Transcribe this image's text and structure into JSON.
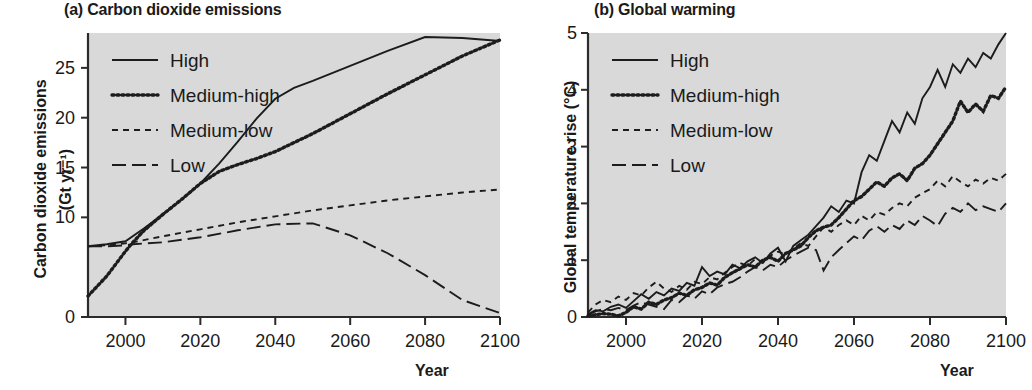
{
  "figure": {
    "background_color": "#ffffff",
    "plot_background_color": "#d9d9d9",
    "line_color": "#1c1c1c"
  },
  "panels": [
    {
      "key": "a",
      "title": "(a) Carbon dioxide emissions",
      "ylabel_line1": "Carbon dioxide emissions",
      "ylabel_line2": "(Gt yr⁻¹)",
      "xlabel": "Year"
    },
    {
      "key": "b",
      "title": "(b) Global warming",
      "ylabel_line1": "Global temperature rise (°C)",
      "ylabel_line2": "",
      "xlabel": "Year"
    }
  ],
  "legend": {
    "entries": [
      {
        "label": "High",
        "style": "solid",
        "dash": ""
      },
      {
        "label": "Medium-high",
        "style": "dotted",
        "dash": "2,3"
      },
      {
        "label": "Medium-low",
        "style": "dashed-short",
        "dash": "6,5"
      },
      {
        "label": "Low",
        "style": "dashed-long",
        "dash": "14,6"
      }
    ]
  },
  "chart_data": [
    {
      "type": "line",
      "panel": "a",
      "title": "(a) Carbon dioxide emissions",
      "xlabel": "Year",
      "ylabel": "Carbon dioxide emissions (Gt yr-1)",
      "xlim": [
        1990,
        2100
      ],
      "ylim": [
        0,
        28.5
      ],
      "xticks": [
        2000,
        2020,
        2040,
        2060,
        2080,
        2100
      ],
      "yticks": [
        0,
        10,
        15,
        20,
        25
      ],
      "ytick_labels": [
        "0",
        "10",
        "15",
        "20",
        "25"
      ],
      "grid": false,
      "legend_position": "upper-left-inside",
      "series": [
        {
          "name": "High",
          "dash": "",
          "x": [
            1990,
            1995,
            2000,
            2005,
            2010,
            2015,
            2020,
            2025,
            2030,
            2035,
            2040,
            2045,
            2050,
            2060,
            2070,
            2080,
            2090,
            2100
          ],
          "values": [
            7.1,
            7.3,
            7.6,
            8.9,
            10.3,
            11.8,
            13.4,
            15.4,
            17.6,
            19.9,
            21.9,
            23.0,
            23.7,
            25.2,
            26.7,
            28.1,
            28.0,
            27.7
          ]
        },
        {
          "name": "Medium-high",
          "dash": "2,3",
          "x": [
            1990,
            1995,
            2000,
            2002,
            2005,
            2010,
            2015,
            2020,
            2025,
            2030,
            2035,
            2040,
            2045,
            2050,
            2060,
            2070,
            2080,
            2090,
            2100
          ],
          "values": [
            2.1,
            4.1,
            6.6,
            7.5,
            8.7,
            10.3,
            11.8,
            13.4,
            14.6,
            15.3,
            15.9,
            16.6,
            17.5,
            18.4,
            20.4,
            22.4,
            24.3,
            26.2,
            27.8
          ]
        },
        {
          "name": "Medium-low",
          "dash": "6,5",
          "x": [
            1990,
            1995,
            2000,
            2002,
            2010,
            2020,
            2030,
            2040,
            2050,
            2060,
            2070,
            2080,
            2090,
            2100
          ],
          "values": [
            7.1,
            7.2,
            7.4,
            7.5,
            8.1,
            8.8,
            9.5,
            10.1,
            10.7,
            11.2,
            11.7,
            12.1,
            12.5,
            12.8
          ]
        },
        {
          "name": "Low",
          "dash": "14,6",
          "x": [
            1990,
            1995,
            2000,
            2002,
            2010,
            2020,
            2030,
            2040,
            2050,
            2060,
            2070,
            2080,
            2090,
            2100
          ],
          "values": [
            7.1,
            7.1,
            7.2,
            7.3,
            7.5,
            8.0,
            8.7,
            9.3,
            9.4,
            8.2,
            6.4,
            4.2,
            1.7,
            0.4
          ]
        }
      ]
    },
    {
      "type": "line",
      "panel": "b",
      "title": "(b) Global warming",
      "xlabel": "Year",
      "ylabel": "Global temperature rise (°C)",
      "xlim": [
        1990,
        2100
      ],
      "ylim": [
        0,
        5
      ],
      "xticks": [
        2000,
        2020,
        2040,
        2060,
        2080,
        2100
      ],
      "yticks": [
        0,
        1,
        2,
        3,
        4,
        5
      ],
      "ytick_labels": [
        "0",
        "1",
        "2",
        "3",
        "4",
        "5"
      ],
      "grid": false,
      "legend_position": "upper-left-inside",
      "note": "Interannually noisy realizations; yearly step series",
      "series": [
        {
          "name": "High",
          "dash": "",
          "x": [
            1990,
            1992,
            1994,
            1996,
            1998,
            2000,
            2002,
            2004,
            2006,
            2008,
            2010,
            2012,
            2014,
            2016,
            2018,
            2020,
            2022,
            2024,
            2026,
            2028,
            2030,
            2032,
            2034,
            2036,
            2038,
            2040,
            2042,
            2044,
            2046,
            2048,
            2050,
            2052,
            2054,
            2056,
            2058,
            2060,
            2062,
            2064,
            2066,
            2068,
            2070,
            2072,
            2074,
            2076,
            2078,
            2080,
            2082,
            2084,
            2086,
            2088,
            2090,
            2092,
            2094,
            2096,
            2098,
            2100
          ],
          "values": [
            0.05,
            0.12,
            0.1,
            0.18,
            0.22,
            0.16,
            0.28,
            0.4,
            0.32,
            0.44,
            0.38,
            0.5,
            0.46,
            0.6,
            0.55,
            0.88,
            0.72,
            0.8,
            0.75,
            0.92,
            0.86,
            0.98,
            1.05,
            0.95,
            1.12,
            1.22,
            0.98,
            1.25,
            1.35,
            1.45,
            1.6,
            1.75,
            1.95,
            1.85,
            2.05,
            2.0,
            2.55,
            2.85,
            2.75,
            3.1,
            3.45,
            3.25,
            3.6,
            3.4,
            3.85,
            4.05,
            4.35,
            4.05,
            4.45,
            4.3,
            4.55,
            4.4,
            4.65,
            4.55,
            4.8,
            5.0
          ]
        },
        {
          "name": "Medium-high",
          "dash": "2,3",
          "x": [
            1990,
            1992,
            1994,
            1996,
            1998,
            2000,
            2002,
            2004,
            2006,
            2008,
            2010,
            2012,
            2014,
            2016,
            2018,
            2020,
            2022,
            2024,
            2026,
            2028,
            2030,
            2032,
            2034,
            2036,
            2038,
            2040,
            2042,
            2044,
            2046,
            2048,
            2050,
            2052,
            2054,
            2056,
            2058,
            2060,
            2062,
            2064,
            2066,
            2068,
            2070,
            2072,
            2074,
            2076,
            2078,
            2080,
            2082,
            2084,
            2086,
            2088,
            2090,
            2092,
            2094,
            2096,
            2098,
            2100
          ],
          "values": [
            0.02,
            0.04,
            0.06,
            0.05,
            0.02,
            0.08,
            0.18,
            0.14,
            0.26,
            0.22,
            0.3,
            0.34,
            0.42,
            0.38,
            0.48,
            0.52,
            0.6,
            0.56,
            0.7,
            0.78,
            0.85,
            0.92,
            0.88,
            1.0,
            1.05,
            0.98,
            1.12,
            1.18,
            1.25,
            1.4,
            1.52,
            1.58,
            1.62,
            1.75,
            1.9,
            2.05,
            2.12,
            2.25,
            2.38,
            2.3,
            2.45,
            2.52,
            2.4,
            2.62,
            2.7,
            2.85,
            3.05,
            3.25,
            3.45,
            3.8,
            3.6,
            3.75,
            3.62,
            3.9,
            3.85,
            4.05
          ]
        },
        {
          "name": "Medium-low",
          "dash": "6,5",
          "x": [
            1990,
            1992,
            1994,
            1996,
            1998,
            2000,
            2002,
            2004,
            2006,
            2008,
            2010,
            2012,
            2014,
            2016,
            2018,
            2020,
            2022,
            2024,
            2026,
            2028,
            2030,
            2032,
            2034,
            2036,
            2038,
            2040,
            2042,
            2044,
            2046,
            2048,
            2050,
            2052,
            2054,
            2056,
            2058,
            2060,
            2062,
            2064,
            2066,
            2068,
            2070,
            2072,
            2074,
            2076,
            2078,
            2080,
            2082,
            2084,
            2086,
            2088,
            2090,
            2092,
            2094,
            2096,
            2098,
            2100
          ],
          "values": [
            0.08,
            0.22,
            0.3,
            0.26,
            0.36,
            0.3,
            0.42,
            0.38,
            0.52,
            0.62,
            0.5,
            0.44,
            0.55,
            0.48,
            0.62,
            0.58,
            0.7,
            0.66,
            0.78,
            0.88,
            0.95,
            0.9,
            1.02,
            0.96,
            1.08,
            1.15,
            1.1,
            1.2,
            1.3,
            1.25,
            1.42,
            1.58,
            1.5,
            1.62,
            1.7,
            1.62,
            1.78,
            1.7,
            1.85,
            1.8,
            1.92,
            2.0,
            1.95,
            2.1,
            2.18,
            2.25,
            2.4,
            2.3,
            2.48,
            2.38,
            2.3,
            2.42,
            2.35,
            2.45,
            2.4,
            2.52
          ]
        },
        {
          "name": "Low",
          "dash": "14,6",
          "x": [
            1990,
            1992,
            1994,
            1996,
            1998,
            2000,
            2002,
            2004,
            2006,
            2008,
            2010,
            2012,
            2014,
            2016,
            2018,
            2020,
            2022,
            2024,
            2026,
            2028,
            2030,
            2032,
            2034,
            2036,
            2038,
            2040,
            2042,
            2044,
            2046,
            2048,
            2050,
            2052,
            2054,
            2056,
            2058,
            2060,
            2062,
            2064,
            2066,
            2068,
            2070,
            2072,
            2074,
            2076,
            2078,
            2080,
            2082,
            2084,
            2086,
            2088,
            2090,
            2092,
            2094,
            2096,
            2098,
            2100
          ],
          "values": [
            0.04,
            0.1,
            0.14,
            0.12,
            0.16,
            0.12,
            0.2,
            0.26,
            0.22,
            0.18,
            0.14,
            0.3,
            0.26,
            0.38,
            0.32,
            0.45,
            0.4,
            0.52,
            0.58,
            0.62,
            0.7,
            0.8,
            0.88,
            0.82,
            0.92,
            0.88,
            1.0,
            1.08,
            1.15,
            1.22,
            1.18,
            0.82,
            1.05,
            1.18,
            1.3,
            1.42,
            1.35,
            1.52,
            1.6,
            1.5,
            1.62,
            1.55,
            1.7,
            1.62,
            1.78,
            1.7,
            1.6,
            1.82,
            1.92,
            1.85,
            2.0,
            1.88,
            1.95,
            1.9,
            1.85,
            2.0
          ]
        }
      ]
    }
  ]
}
